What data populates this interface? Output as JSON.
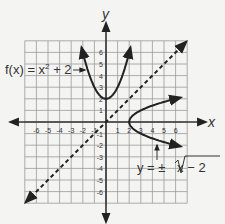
{
  "graph": {
    "axis_x_label": "x",
    "axis_y_label": "y",
    "x_ticks": [
      "-6",
      "-5",
      "-4",
      "-3",
      "-2",
      "-1",
      "1",
      "2",
      "3",
      "4",
      "5",
      "6"
    ],
    "y_ticks": [
      "6",
      "5",
      "4",
      "3",
      "2",
      "1",
      "-1",
      "-2",
      "-3",
      "-4",
      "-5",
      "-6"
    ],
    "func1_label_lhs": "f(x) = x",
    "func1_label_exp": "2",
    "func1_label_rhs": " + 2",
    "func2_label_lhs": "y = ± ",
    "func2_label_rad": "x − 2",
    "colors": {
      "grid": "#9a9a9a",
      "axis": "#333333",
      "curve": "#222222",
      "background": "#f4f4f3"
    }
  },
  "chart_data": {
    "type": "line",
    "title": "",
    "xlabel": "x",
    "ylabel": "y",
    "xlim": [
      -7,
      7
    ],
    "ylim": [
      -7,
      7
    ],
    "grid": true,
    "series": [
      {
        "name": "f(x) = x^2 + 2",
        "style": "solid",
        "x": [
          -2.1,
          -1.5,
          -1,
          -0.5,
          0,
          0.5,
          1,
          1.5,
          2.1
        ],
        "y": [
          6.41,
          4.25,
          3,
          2.25,
          2,
          2.25,
          3,
          4.25,
          6.41
        ]
      },
      {
        "name": "y = ±√(x − 2)",
        "style": "solid",
        "x": [
          6.4,
          5,
          4,
          3,
          2,
          3,
          4,
          5,
          6.4
        ],
        "y": [
          -2.1,
          -1.73,
          -1.41,
          -1,
          0,
          1,
          1.41,
          1.73,
          2.1
        ]
      },
      {
        "name": "y = x",
        "style": "dashed",
        "x": [
          -7,
          7
        ],
        "y": [
          -7,
          7
        ]
      }
    ]
  }
}
